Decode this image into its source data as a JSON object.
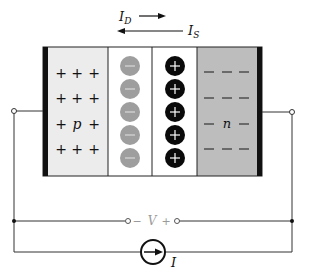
{
  "diagram": {
    "colors": {
      "p_region": "#ececec",
      "depletion": "#ffffff",
      "n_region": "#bdbdbd",
      "contact": "#111111",
      "acceptor_ion": "#9e9e9e",
      "donor_ion": "#0a0a0a",
      "wire": "#333333"
    },
    "currents": {
      "diffusion": {
        "label": "I",
        "subscript": "D",
        "direction": "right"
      },
      "drift": {
        "label": "I",
        "subscript": "S",
        "direction": "left"
      }
    },
    "regions": {
      "p": {
        "label": "p",
        "carrier_sign": "+",
        "rows": 4,
        "cols": 3
      },
      "depletion_p_side": {
        "ion_sign": "−",
        "ion_count": 5
      },
      "depletion_n_side": {
        "ion_sign": "+",
        "ion_count": 5
      },
      "n": {
        "label": "n",
        "carrier_sign": "−",
        "rows": 4,
        "cols": 3
      }
    },
    "voltage": {
      "minus": "−",
      "label": "V",
      "plus": "+"
    },
    "source": {
      "label": "I",
      "type": "current-source",
      "arrow": "right"
    }
  }
}
